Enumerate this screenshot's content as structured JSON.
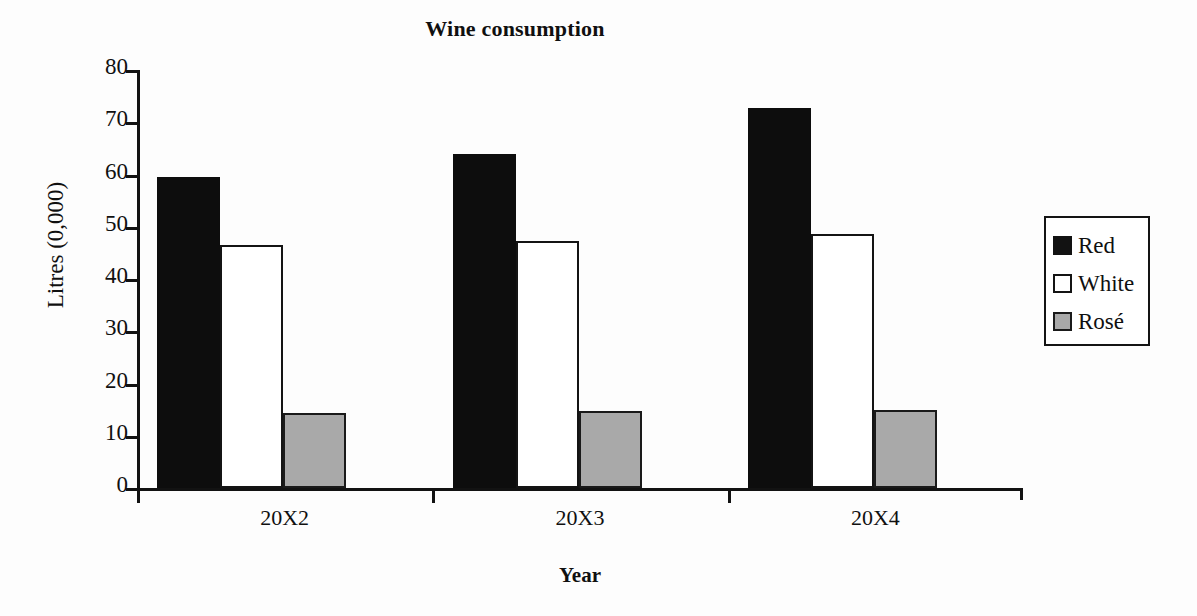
{
  "chart_data": {
    "type": "bar",
    "title": "Wine consumption",
    "xlabel": "Year",
    "ylabel": "Litres (0,000)",
    "categories": [
      "20X2",
      "20X3",
      "20X4"
    ],
    "series": [
      {
        "name": "Red",
        "color": "#0d0d0d",
        "values": [
          59.5,
          63.9,
          72.8
        ]
      },
      {
        "name": "White",
        "color": "#ffffff",
        "values": [
          46.6,
          47.3,
          48.6
        ]
      },
      {
        "name": "Rosé",
        "color": "#a9a9a9",
        "values": [
          14.3,
          14.7,
          15.0
        ]
      }
    ],
    "ylim": [
      0,
      80
    ],
    "yticks": [
      0,
      10,
      20,
      30,
      40,
      50,
      60,
      70,
      80
    ],
    "ytick_labels": [
      "0",
      "10",
      "20",
      "30",
      "40",
      "50",
      "60",
      "70",
      "80"
    ],
    "grid": false,
    "legend_position": "right",
    "legend_entries": [
      "Red",
      "White",
      "Rosé"
    ]
  },
  "legend": {
    "items": [
      {
        "label": "Red",
        "swatch": "red-swatch-icon"
      },
      {
        "label": "White",
        "swatch": "white-swatch-icon"
      },
      {
        "label": "Rosé",
        "swatch": "rose-swatch-icon"
      }
    ]
  }
}
